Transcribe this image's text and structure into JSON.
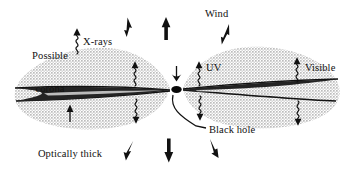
{
  "figure": {
    "background_color": "#ffffff",
    "ink_color": "#111111",
    "halo_color": "#c9c9c9",
    "disc_color": "#1a1a1a",
    "width_px": 353,
    "height_px": 172
  },
  "labels": {
    "possible_corona_line1": "Possible",
    "possible_corona_line2": "corona",
    "xrays": "X-rays",
    "wind": "Wind",
    "uv": "UV",
    "visible": "Visible",
    "black_hole": "Black hole",
    "optically_thick_line1": "Optically thick",
    "optically_thick_line2": "disc"
  },
  "annotations": {
    "wind_arrows": [
      {
        "name": "wind-arrow-top-left",
        "direction": "up-left"
      },
      {
        "name": "wind-arrow-top-center",
        "direction": "up"
      },
      {
        "name": "wind-arrow-top-right",
        "direction": "up-right"
      },
      {
        "name": "wind-arrow-bottom-left",
        "direction": "down-left"
      },
      {
        "name": "wind-arrow-bottom-center",
        "direction": "down"
      },
      {
        "name": "wind-arrow-bottom-right",
        "direction": "down-right"
      }
    ],
    "radiation_squiggles": [
      {
        "name": "xrays-squiggle",
        "label": "X-rays",
        "side": "upper-left-corona"
      },
      {
        "name": "disc-squiggle-left-upper",
        "label": "",
        "side": "left-above-disc"
      },
      {
        "name": "disc-squiggle-left-lower",
        "label": "",
        "side": "left-below-disc"
      },
      {
        "name": "uv-squiggle-upper",
        "label": "UV",
        "side": "right-inner-above-disc"
      },
      {
        "name": "uv-squiggle-lower",
        "label": "",
        "side": "right-inner-below-disc"
      },
      {
        "name": "visible-squiggle-upper",
        "label": "Visible",
        "side": "right-outer-above-disc"
      },
      {
        "name": "visible-squiggle-lower",
        "label": "",
        "side": "right-outer-below-disc"
      }
    ],
    "infall_arrow": {
      "name": "infall-arrow",
      "direction": "down",
      "target": "black hole"
    },
    "black_hole_marker": {
      "name": "black-hole-dot",
      "shape": "filled-ellipse"
    },
    "disc_pointer_arrow": {
      "name": "optically-thick-disc-pointer",
      "direction": "up"
    },
    "black_hole_leader": {
      "name": "black-hole-leader-line",
      "shape": "curved-leader"
    }
  }
}
